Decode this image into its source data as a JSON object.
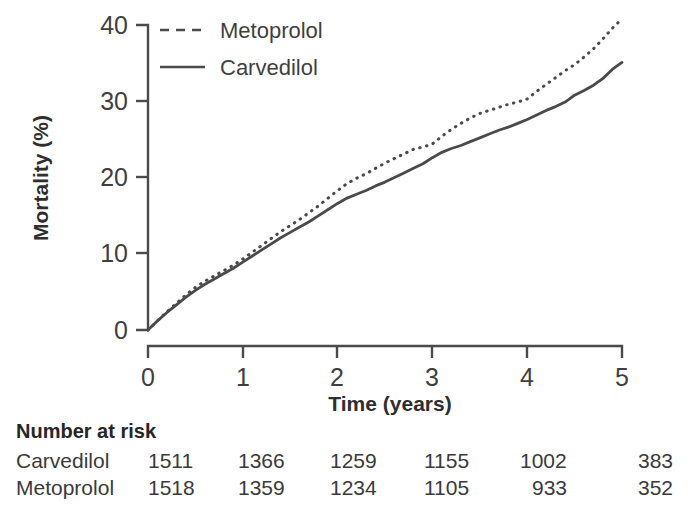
{
  "chart_data": {
    "type": "line",
    "title": "",
    "xlabel": "Time (years)",
    "ylabel": "Mortality (%)",
    "xlim": [
      0,
      5
    ],
    "ylim": [
      0,
      42
    ],
    "xticks": [
      0,
      1,
      2,
      3,
      4,
      5
    ],
    "yticks": [
      0,
      10,
      20,
      30,
      40
    ],
    "xtick_labels": [
      "0",
      "1",
      "2",
      "3",
      "4",
      "5"
    ],
    "ytick_labels": [
      "0",
      "10",
      "20",
      "30",
      "40"
    ],
    "grid": false,
    "legend_position": "top-left",
    "x": [
      0,
      0.1,
      0.2,
      0.3,
      0.4,
      0.5,
      0.6,
      0.7,
      0.8,
      0.9,
      1.0,
      1.1,
      1.2,
      1.3,
      1.4,
      1.5,
      1.6,
      1.7,
      1.8,
      1.9,
      2.0,
      2.1,
      2.2,
      2.3,
      2.4,
      2.5,
      2.6,
      2.7,
      2.8,
      2.9,
      3.0,
      3.1,
      3.2,
      3.3,
      3.4,
      3.5,
      3.6,
      3.7,
      3.8,
      3.9,
      4.0,
      4.1,
      4.2,
      4.3,
      4.4,
      4.5,
      4.6,
      4.7,
      4.8,
      4.9,
      5.0
    ],
    "series": [
      {
        "name": "Metoprolol",
        "style": "dotted",
        "color": "#4a4a4a",
        "values": [
          0.0,
          1.2,
          2.4,
          3.5,
          4.6,
          5.6,
          6.4,
          7.1,
          7.8,
          8.5,
          9.3,
          10.2,
          11.1,
          12.0,
          12.9,
          13.7,
          14.5,
          15.4,
          16.3,
          17.3,
          18.3,
          19.2,
          19.9,
          20.5,
          21.2,
          21.9,
          22.5,
          23.1,
          23.7,
          24.0,
          24.4,
          25.4,
          26.3,
          27.1,
          27.8,
          28.4,
          28.8,
          29.2,
          29.6,
          29.9,
          30.3,
          31.3,
          32.2,
          33.1,
          34.0,
          34.8,
          35.8,
          36.9,
          38.2,
          39.6,
          40.8
        ]
      },
      {
        "name": "Carvedilol",
        "style": "solid",
        "color": "#4a4a4a",
        "values": [
          0.0,
          1.2,
          2.3,
          3.3,
          4.3,
          5.2,
          6.0,
          6.7,
          7.4,
          8.1,
          8.9,
          9.7,
          10.5,
          11.3,
          12.1,
          12.8,
          13.5,
          14.2,
          15.0,
          15.8,
          16.6,
          17.3,
          17.8,
          18.3,
          18.9,
          19.4,
          20.0,
          20.6,
          21.2,
          21.8,
          22.6,
          23.3,
          23.8,
          24.2,
          24.7,
          25.2,
          25.7,
          26.2,
          26.6,
          27.1,
          27.6,
          28.2,
          28.8,
          29.3,
          29.9,
          30.8,
          31.4,
          32.1,
          33.0,
          34.2,
          35.1
        ]
      }
    ]
  },
  "legend": {
    "entries": [
      {
        "label": "Metoprolol",
        "style": "dotted"
      },
      {
        "label": "Carvedilol",
        "style": "solid"
      }
    ]
  },
  "axes": {
    "y_title": "Mortality (%)",
    "x_title": "Time (years)",
    "y_labels": [
      "40",
      "30",
      "20",
      "10",
      "0"
    ],
    "x_labels": [
      "0",
      "1",
      "2",
      "3",
      "4",
      "5"
    ]
  },
  "risk_table": {
    "heading": "Number at risk",
    "rows": [
      {
        "label": "Carvedilol",
        "values": [
          "1511",
          "1366",
          "1259",
          "1155",
          "1002",
          "383"
        ]
      },
      {
        "label": "Metoprolol",
        "values": [
          "1518",
          "1359",
          "1234",
          "1105",
          "933",
          "352"
        ]
      }
    ]
  },
  "colors": {
    "line": "#4a4a4a",
    "axis": "#4a4a4a",
    "text": "#3a3a3a"
  }
}
